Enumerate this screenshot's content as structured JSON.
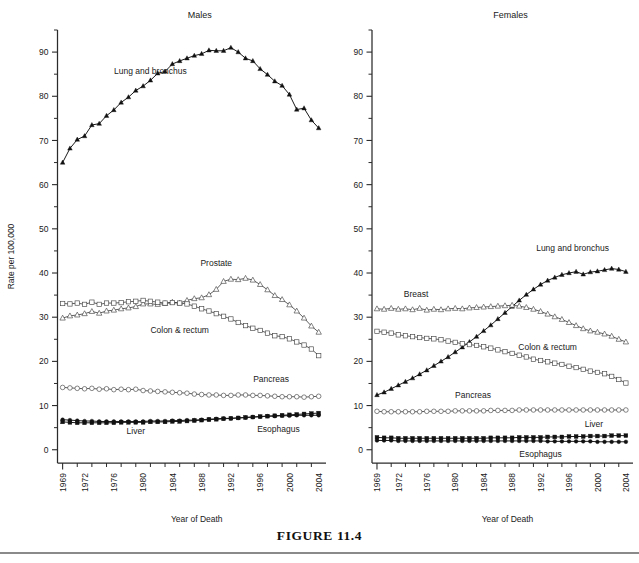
{
  "figure": {
    "caption": "FIGURE 11.4",
    "rule_visible": true
  },
  "chart_data": [
    {
      "type": "line",
      "title": "Males",
      "xlabel": "Year of Death",
      "ylabel": "Rate per 100,000",
      "xlim": [
        1968.3,
        2005.0
      ],
      "ylim": [
        -3,
        95
      ],
      "grid": false,
      "legend": "inline-annotations",
      "xticks": [
        1969,
        1972,
        1976,
        1980,
        1984,
        1988,
        1992,
        1996,
        2000,
        2004
      ],
      "xtick_labels": [
        "1969",
        "1972",
        "1976",
        "1980",
        "1984",
        "1988",
        "1992",
        "1996",
        "2000",
        "2004"
      ],
      "xminor_step": 2,
      "yticks": [
        0,
        10,
        20,
        30,
        40,
        50,
        60,
        70,
        80,
        90
      ],
      "ytick_labels": [
        "0",
        "10",
        "20",
        "30",
        "40",
        "50",
        "60",
        "70",
        "80",
        "90"
      ],
      "yminor": [
        5,
        15,
        25,
        35,
        45,
        55,
        65,
        75,
        85,
        95
      ],
      "x": [
        1969,
        1970,
        1971,
        1972,
        1973,
        1974,
        1975,
        1976,
        1977,
        1978,
        1979,
        1980,
        1981,
        1982,
        1983,
        1984,
        1985,
        1986,
        1987,
        1988,
        1989,
        1990,
        1991,
        1992,
        1993,
        1994,
        1995,
        1996,
        1997,
        1998,
        1999,
        2000,
        2001,
        2002,
        2003,
        2004
      ],
      "series": [
        {
          "name": "Lung and bronchus",
          "marker": "filled-triangle",
          "label_x": 1981.0,
          "label_y": 85.0,
          "values": [
            65.0,
            68.2,
            70.2,
            71.0,
            73.5,
            73.8,
            75.6,
            76.9,
            78.6,
            79.8,
            81.3,
            82.3,
            83.6,
            85.2,
            85.6,
            87.3,
            88.0,
            88.6,
            89.2,
            89.6,
            90.4,
            90.3,
            90.3,
            91.0,
            90.0,
            88.6,
            88.0,
            86.2,
            84.9,
            83.4,
            82.4,
            80.4,
            77.0,
            77.3,
            74.6,
            72.8
          ]
        },
        {
          "name": "Prostate",
          "marker": "open-triangle",
          "label_x": 1990.0,
          "label_y": 41.6,
          "values": [
            29.8,
            30.3,
            30.5,
            30.8,
            31.3,
            30.9,
            31.4,
            31.6,
            31.9,
            32.1,
            32.4,
            33.0,
            33.0,
            32.9,
            33.1,
            33.4,
            33.2,
            33.8,
            34.2,
            34.4,
            35.1,
            36.3,
            38.1,
            38.6,
            38.5,
            38.8,
            38.4,
            37.4,
            36.2,
            34.9,
            34.0,
            32.8,
            31.4,
            29.8,
            28.0,
            26.6
          ]
        },
        {
          "name": "Colon & rectum",
          "marker": "open-square",
          "label_x": 1985.0,
          "label_y": 26.5,
          "values": [
            33.1,
            33.0,
            33.2,
            32.9,
            33.4,
            32.9,
            33.2,
            33.2,
            33.3,
            33.5,
            33.6,
            33.8,
            33.6,
            33.4,
            33.2,
            33.3,
            33.2,
            33.0,
            32.5,
            31.9,
            31.4,
            30.8,
            30.2,
            29.6,
            28.8,
            28.1,
            27.5,
            27.0,
            26.4,
            25.8,
            25.6,
            25.1,
            24.4,
            23.7,
            22.8,
            21.3
          ]
        },
        {
          "name": "Pancreas",
          "marker": "open-circle",
          "label_x": 1997.5,
          "label_y": 15.3,
          "values": [
            14.1,
            14.0,
            13.9,
            13.8,
            13.9,
            13.7,
            13.8,
            13.6,
            13.7,
            13.6,
            13.7,
            13.4,
            13.3,
            13.2,
            13.1,
            13.0,
            12.9,
            12.8,
            12.6,
            12.5,
            12.4,
            12.4,
            12.3,
            12.3,
            12.4,
            12.4,
            12.3,
            12.3,
            12.2,
            12.1,
            12.0,
            12.0,
            12.0,
            11.9,
            12.0,
            12.1
          ]
        },
        {
          "name": "Liver",
          "marker": "filled-square",
          "label_x": 1979.0,
          "label_y": 3.6,
          "values": [
            6.3,
            6.2,
            6.1,
            6.1,
            6.1,
            6.1,
            6.1,
            6.1,
            6.2,
            6.2,
            6.2,
            6.2,
            6.3,
            6.3,
            6.3,
            6.4,
            6.4,
            6.5,
            6.6,
            6.7,
            6.8,
            6.9,
            7.0,
            7.1,
            7.2,
            7.3,
            7.4,
            7.5,
            7.6,
            7.7,
            7.8,
            7.9,
            8.0,
            8.1,
            8.2,
            8.3
          ]
        },
        {
          "name": "Esophagus",
          "marker": "filled-circle",
          "label_x": 1998.5,
          "label_y": 4.1,
          "values": [
            6.8,
            6.7,
            6.6,
            6.5,
            6.5,
            6.4,
            6.4,
            6.4,
            6.4,
            6.4,
            6.4,
            6.4,
            6.5,
            6.5,
            6.5,
            6.6,
            6.6,
            6.7,
            6.7,
            6.8,
            6.9,
            7.0,
            7.1,
            7.1,
            7.2,
            7.3,
            7.4,
            7.5,
            7.6,
            7.6,
            7.7,
            7.7,
            7.8,
            7.8,
            7.8,
            7.8
          ]
        }
      ]
    },
    {
      "type": "line",
      "title": "Females",
      "xlabel": "Year of Death",
      "ylabel": "",
      "xlim": [
        1968.3,
        2005.0
      ],
      "ylim": [
        -3,
        95
      ],
      "grid": false,
      "legend": "inline-annotations",
      "xticks": [
        1969,
        1972,
        1976,
        1980,
        1984,
        1988,
        1992,
        1996,
        2000,
        2004
      ],
      "xtick_labels": [
        "1969",
        "1972",
        "1976",
        "1980",
        "1984",
        "1988",
        "1992",
        "1996",
        "2000",
        "2004"
      ],
      "xminor_step": 2,
      "yticks": [
        0,
        10,
        20,
        30,
        40,
        50,
        60,
        70,
        80,
        90
      ],
      "ytick_labels": [
        "0",
        "10",
        "20",
        "30",
        "40",
        "50",
        "60",
        "70",
        "80",
        "90"
      ],
      "yminor": [
        5,
        15,
        25,
        35,
        45,
        55,
        65,
        75,
        85,
        95
      ],
      "x": [
        1969,
        1970,
        1971,
        1972,
        1973,
        1974,
        1975,
        1976,
        1977,
        1978,
        1979,
        1980,
        1981,
        1982,
        1983,
        1984,
        1985,
        1986,
        1987,
        1988,
        1989,
        1990,
        1991,
        1992,
        1993,
        1994,
        1995,
        1996,
        1997,
        1998,
        1999,
        2000,
        2001,
        2002,
        2003,
        2004
      ],
      "series": [
        {
          "name": "Lung and bronchus",
          "marker": "filled-triangle",
          "label_x": 1996.5,
          "label_y": 45.0,
          "values": [
            12.4,
            13.0,
            13.8,
            14.6,
            15.4,
            16.2,
            17.1,
            18.0,
            19.0,
            20.0,
            21.0,
            22.1,
            23.2,
            24.4,
            25.6,
            26.9,
            28.2,
            29.6,
            31.0,
            32.4,
            33.8,
            35.1,
            36.3,
            37.4,
            38.3,
            39.0,
            39.6,
            40.0,
            40.3,
            39.7,
            40.2,
            40.4,
            40.7,
            41.0,
            40.8,
            40.3
          ]
        },
        {
          "name": "Breast",
          "marker": "open-triangle",
          "label_x": 1974.5,
          "label_y": 34.5,
          "values": [
            31.9,
            31.8,
            32.0,
            31.8,
            31.9,
            31.7,
            32.0,
            31.6,
            31.8,
            31.7,
            31.9,
            32.0,
            31.9,
            32.1,
            32.2,
            32.3,
            32.4,
            32.5,
            32.6,
            32.7,
            32.5,
            32.2,
            31.8,
            31.3,
            30.7,
            30.1,
            29.5,
            28.8,
            28.1,
            27.4,
            26.9,
            26.6,
            26.2,
            25.7,
            25.0,
            24.4
          ]
        },
        {
          "name": "Colon & rectum",
          "marker": "open-square",
          "label_x": 1993.0,
          "label_y": 22.5,
          "values": [
            26.8,
            26.6,
            26.4,
            26.0,
            25.8,
            25.6,
            25.4,
            25.2,
            25.1,
            24.9,
            24.6,
            24.3,
            24.0,
            23.8,
            23.6,
            23.3,
            23.0,
            22.6,
            22.2,
            21.8,
            21.4,
            21.0,
            20.5,
            20.2,
            19.9,
            19.6,
            19.3,
            18.9,
            18.6,
            18.2,
            17.8,
            17.5,
            17.2,
            16.6,
            15.9,
            15.1
          ]
        },
        {
          "name": "Pancreas",
          "marker": "open-circle",
          "label_x": 1982.5,
          "label_y": 11.6,
          "values": [
            8.7,
            8.6,
            8.6,
            8.6,
            8.6,
            8.6,
            8.6,
            8.7,
            8.7,
            8.7,
            8.7,
            8.8,
            8.8,
            8.8,
            8.8,
            8.8,
            8.9,
            8.9,
            8.9,
            8.9,
            9.0,
            9.0,
            9.0,
            9.0,
            9.0,
            9.0,
            9.0,
            9.0,
            9.0,
            9.0,
            9.0,
            9.0,
            9.0,
            9.0,
            9.0,
            9.0
          ]
        },
        {
          "name": "Liver",
          "marker": "filled-square",
          "label_x": 1999.5,
          "label_y": 5.2,
          "values": [
            2.8,
            2.7,
            2.7,
            2.6,
            2.6,
            2.6,
            2.6,
            2.6,
            2.6,
            2.6,
            2.6,
            2.6,
            2.6,
            2.6,
            2.6,
            2.6,
            2.7,
            2.7,
            2.7,
            2.7,
            2.8,
            2.8,
            2.8,
            2.8,
            2.9,
            2.9,
            2.9,
            3.0,
            3.0,
            3.0,
            3.1,
            3.1,
            3.1,
            3.2,
            3.2,
            3.2
          ]
        },
        {
          "name": "Esophagus",
          "marker": "filled-circle",
          "label_x": 1992.0,
          "label_y": -1.6,
          "values": [
            2.1,
            2.1,
            2.1,
            2.0,
            2.0,
            2.0,
            2.0,
            2.0,
            2.0,
            2.0,
            2.0,
            2.0,
            2.0,
            2.0,
            2.0,
            2.0,
            2.0,
            2.0,
            2.0,
            2.0,
            2.0,
            2.0,
            2.0,
            2.0,
            1.9,
            1.9,
            1.9,
            1.9,
            1.9,
            1.9,
            1.9,
            1.8,
            1.8,
            1.8,
            1.8,
            1.8
          ]
        }
      ]
    }
  ]
}
